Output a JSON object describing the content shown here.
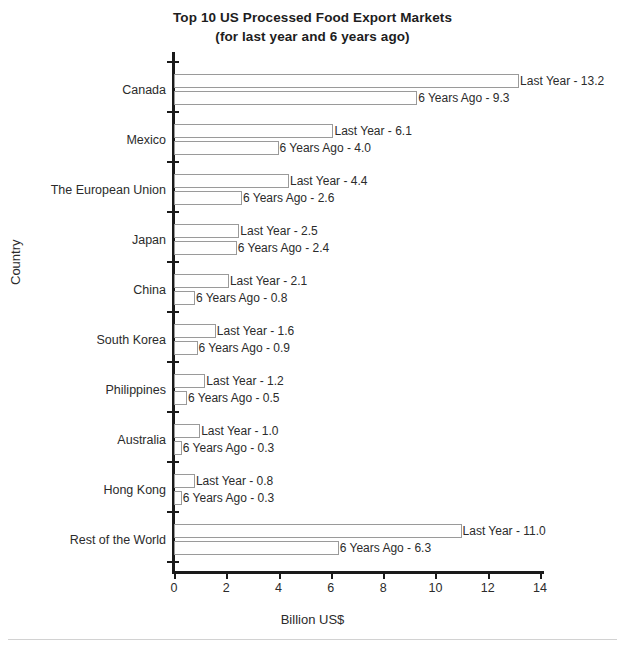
{
  "chart_data": {
    "type": "bar",
    "orientation": "horizontal",
    "title": "Top 10 US Processed Food Export Markets",
    "subtitle": "(for last year and 6 years ago)",
    "xlabel": "Billion US$",
    "ylabel": "Country",
    "xlim": [
      0,
      14
    ],
    "xticks": [
      "0",
      "2",
      "4",
      "6",
      "8",
      "10",
      "12",
      "14"
    ],
    "grid": false,
    "legend": "none",
    "categories": [
      "Canada",
      "Mexico",
      "The European Union",
      "Japan",
      "China",
      "South Korea",
      "Philippines",
      "Australia",
      "Hong Kong",
      "Rest of the World"
    ],
    "series": [
      {
        "name": "Last Year",
        "label_prefix": "Last Year - ",
        "values": [
          13.2,
          6.1,
          4.4,
          2.5,
          2.1,
          1.6,
          1.2,
          1.0,
          0.8,
          11.0
        ]
      },
      {
        "name": "6 Years Ago",
        "label_prefix": "6 Years Ago - ",
        "values": [
          9.3,
          4.0,
          2.6,
          2.4,
          0.8,
          0.9,
          0.5,
          0.3,
          0.3,
          6.3
        ]
      }
    ],
    "point_labels": [
      [
        "Last Year - 13.2",
        "6 Years Ago - 9.3"
      ],
      [
        "Last Year - 6.1",
        "6 Years Ago - 4.0"
      ],
      [
        "Last Year - 4.4",
        "6 Years Ago - 2.6"
      ],
      [
        "Last Year - 2.5",
        "6 Years Ago - 2.4"
      ],
      [
        "Last Year - 2.1",
        "6 Years Ago - 0.8"
      ],
      [
        "Last Year - 1.6",
        "6 Years Ago - 0.9"
      ],
      [
        "Last Year - 1.2",
        "6 Years Ago - 0.5"
      ],
      [
        "Last Year - 1.0",
        "6 Years Ago - 0.3"
      ],
      [
        "Last Year - 0.8",
        "6 Years Ago - 0.3"
      ],
      [
        "Last Year - 11.0",
        "6 Years Ago - 6.3"
      ]
    ],
    "colors": {
      "bar_fill": "#ffffff",
      "bar_border": "#9a9a9a",
      "axis": "#1a1a1a",
      "text": "#2b2b2b"
    }
  }
}
